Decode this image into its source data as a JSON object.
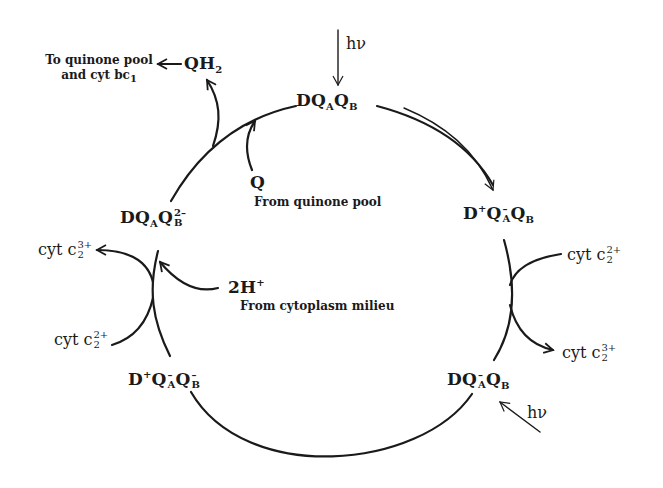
{
  "diagram": {
    "type": "cycle",
    "states": {
      "top": {
        "base": "DQ",
        "a_sub": "A",
        "a_sup": "",
        "q": "Q",
        "b_sub": "B",
        "b_sup": "",
        "prefix": ""
      },
      "right_upper": {
        "prefix": "D",
        "prefix_sup": "+",
        "base": "Q",
        "a_sub": "A",
        "a_sup": "–",
        "q": "Q",
        "b_sub": "B",
        "b_sup": ""
      },
      "right_lower": {
        "prefix": "D",
        "prefix_sup": "",
        "base": "Q",
        "a_sub": "A",
        "a_sup": "–",
        "q": "Q",
        "b_sub": "B",
        "b_sup": ""
      },
      "left_lower": {
        "prefix": "D",
        "prefix_sup": "+",
        "base": "Q",
        "a_sub": "A",
        "a_sup": "–",
        "q": "Q",
        "b_sub": "B",
        "b_sup": "–"
      },
      "left_upper": {
        "prefix": "D",
        "prefix_sup": "",
        "base": "Q",
        "a_sub": "A",
        "a_sup": "",
        "q": "Q",
        "b_sub": "B",
        "b_sup": "2–"
      }
    },
    "light": {
      "top_label": "hν",
      "bottom_right_label": "hν"
    },
    "cytochromes": {
      "right_in": {
        "text": "cyt c",
        "sub": "2",
        "sup": "2+"
      },
      "right_out": {
        "text": "cyt c",
        "sub": "2",
        "sup": "3+"
      },
      "left_in": {
        "text": "cyt c",
        "sub": "2",
        "sup": "2+"
      },
      "left_out": {
        "text": "cyt c",
        "sub": "2",
        "sup": "3+"
      }
    },
    "quinone": {
      "product": "QH",
      "product_sub": "2",
      "product_note_line1": "To quinone pool",
      "product_note_line2": "and cyt bc",
      "product_note_sub": "1",
      "substrate": "Q",
      "substrate_note": "From quinone pool"
    },
    "protons": {
      "label": "2H",
      "label_sup": "+",
      "note": "From cytoplasm milieu"
    }
  }
}
